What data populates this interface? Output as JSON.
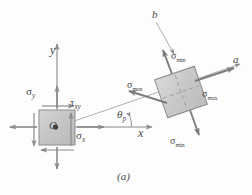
{
  "figure": {
    "caption": "(a)",
    "axes": {
      "y_label": "y",
      "x_label": "x",
      "angle_label": "θ",
      "angle_sub": "p"
    },
    "principal_axes": {
      "a_label": "a",
      "b_label": "b"
    },
    "element_left": {
      "origin_label": "O",
      "sigma_y": {
        "symbol": "σ",
        "sub": "y"
      },
      "sigma_x": {
        "symbol": "σ",
        "sub": "x"
      },
      "tau_xy": {
        "symbol": "τ",
        "sub": "xy"
      }
    },
    "element_right": {
      "sigma_max_left": {
        "symbol": "σ",
        "sub": "max"
      },
      "sigma_max_right": {
        "symbol": "σ",
        "sub": "max"
      },
      "sigma_min_top": {
        "symbol": "σ",
        "sub": "min"
      },
      "sigma_min_bottom": {
        "symbol": "σ",
        "sub": "min"
      }
    },
    "colors": {
      "stroke": "#8a8a8a",
      "fill": "#c9c9c9",
      "text": "#4a4a4a",
      "background": "#fdfdfd"
    }
  }
}
